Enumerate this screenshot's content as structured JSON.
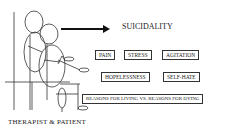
{
  "diagram": {
    "title": "SUICIDALITY",
    "caption": "THERAPIST & PATIENT",
    "rows": [
      [
        "PAIN",
        "STRESS",
        "AGITATION"
      ],
      [
        "HOPELESSNESS",
        "SELF-HATE"
      ],
      [
        "REASONS FOR LIVING VS. REASONS FOR DYING"
      ]
    ],
    "arrow_direction": "right"
  }
}
